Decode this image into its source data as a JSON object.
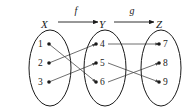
{
  "figure": {
    "stroke_color": "#1a1a1a",
    "line_color": "#4a4a4a",
    "background": "#ffffff"
  },
  "sets": [
    {
      "id": "X",
      "label": "X",
      "cx": 50,
      "cy": 68,
      "rx": 21,
      "ry": 38,
      "label_x": 41,
      "label_y": 28,
      "elements": [
        {
          "label": "1",
          "dot_x": 49,
          "dot_y": 44,
          "text_x": 38,
          "text_y": 47
        },
        {
          "label": "2",
          "dot_x": 49,
          "dot_y": 63,
          "text_x": 38,
          "text_y": 66
        },
        {
          "label": "3",
          "dot_x": 49,
          "dot_y": 82,
          "text_x": 38,
          "text_y": 85
        }
      ]
    },
    {
      "id": "Y",
      "label": "Y",
      "cx": 105,
      "cy": 68,
      "rx": 21,
      "ry": 38,
      "label_x": 99,
      "label_y": 28,
      "elements": [
        {
          "label": "4",
          "dot_x": 96,
          "dot_y": 44,
          "text_x": 100,
          "text_y": 47
        },
        {
          "label": "5",
          "dot_x": 96,
          "dot_y": 63,
          "text_x": 100,
          "text_y": 66
        },
        {
          "label": "6",
          "dot_x": 96,
          "dot_y": 82,
          "text_x": 100,
          "text_y": 85
        }
      ]
    },
    {
      "id": "Z",
      "label": "Z",
      "cx": 161,
      "cy": 68,
      "rx": 20,
      "ry": 38,
      "label_x": 156,
      "label_y": 28,
      "elements": [
        {
          "label": "7",
          "dot_x": 159,
          "dot_y": 44,
          "text_x": 163,
          "text_y": 47
        },
        {
          "label": "8",
          "dot_x": 159,
          "dot_y": 63,
          "text_x": 163,
          "text_y": 66
        },
        {
          "label": "9",
          "dot_x": 159,
          "dot_y": 82,
          "text_x": 163,
          "text_y": 85
        }
      ]
    }
  ],
  "functions": [
    {
      "name": "f",
      "label": "f",
      "domain": "X",
      "codomain": "Y",
      "arrow_x1": 58,
      "arrow_x2": 98,
      "arrow_y": 22,
      "label_x": 76,
      "label_y": 14
    },
    {
      "name": "g",
      "label": "g",
      "domain": "Y",
      "codomain": "Z",
      "arrow_x1": 114,
      "arrow_x2": 154,
      "arrow_y": 22,
      "label_x": 132,
      "label_y": 14
    }
  ],
  "mappings": {
    "f": [
      {
        "from": "1",
        "to": "6",
        "x1": 49,
        "y1": 44,
        "x2": 96,
        "y2": 82
      },
      {
        "from": "2",
        "to": "4",
        "x1": 49,
        "y1": 63,
        "x2": 96,
        "y2": 44
      },
      {
        "from": "3",
        "to": "5",
        "x1": 49,
        "y1": 82,
        "x2": 96,
        "y2": 63
      }
    ],
    "g": [
      {
        "from": "4",
        "to": "7",
        "x1": 108,
        "y1": 44,
        "x2": 159,
        "y2": 44
      },
      {
        "from": "5",
        "to": "9",
        "x1": 108,
        "y1": 63,
        "x2": 159,
        "y2": 82
      },
      {
        "from": "6",
        "to": "8",
        "x1": 108,
        "y1": 82,
        "x2": 159,
        "y2": 63
      }
    ]
  },
  "dot_radius": 1.8
}
